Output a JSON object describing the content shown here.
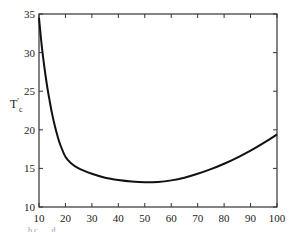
{
  "chart_data": {
    "type": "line",
    "title": "",
    "xlabel": "",
    "ylabel": "T'c",
    "ylabel_main": "T",
    "ylabel_prime": "'",
    "ylabel_sub": "c",
    "xlim": [
      10,
      100
    ],
    "ylim": [
      10,
      35
    ],
    "grid": false,
    "legend": null,
    "xticks": [
      10,
      20,
      30,
      40,
      50,
      60,
      70,
      80,
      90,
      100
    ],
    "yticks": [
      10,
      15,
      20,
      25,
      30,
      35
    ],
    "x": [
      10,
      11,
      12,
      13,
      14,
      15,
      16,
      17,
      18,
      20,
      22,
      25,
      30,
      35,
      40,
      45,
      50,
      55,
      60,
      65,
      70,
      75,
      80,
      85,
      90,
      95,
      100
    ],
    "series": [
      {
        "name": "T'c",
        "color": "#111111",
        "values": [
          34.5,
          31.0,
          28.2,
          25.8,
          23.8,
          22.0,
          20.5,
          19.2,
          18.1,
          16.5,
          15.7,
          15.0,
          14.3,
          13.8,
          13.5,
          13.3,
          13.2,
          13.25,
          13.45,
          13.8,
          14.3,
          14.9,
          15.6,
          16.4,
          17.3,
          18.3,
          19.4
        ]
      }
    ]
  },
  "caption": "... b c . ... d ... ..."
}
